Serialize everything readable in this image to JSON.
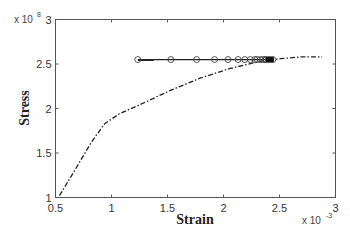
{
  "chart_data": {
    "type": "line",
    "title": "",
    "xlabel": "Strain",
    "ylabel": "Stress",
    "x_multiplier": "x 10",
    "x_multiplier_exp": "-3",
    "y_multiplier": "x 10",
    "y_multiplier_exp": "8",
    "xlim": [
      0.5,
      3
    ],
    "ylim": [
      1,
      3
    ],
    "xticks": [
      0.5,
      1,
      1.5,
      2,
      2.5,
      3
    ],
    "xtick_labels": [
      "0.5",
      "1",
      "1.5",
      "2",
      "2.5",
      "3"
    ],
    "yticks": [
      1,
      1.5,
      2,
      2.5,
      3
    ],
    "ytick_labels": [
      "1",
      "1.5",
      "2",
      "2.5",
      "3"
    ],
    "grid": false,
    "legend": null,
    "series": [
      {
        "name": "stress-strain curve",
        "style": "dash-dot",
        "color": "#222222",
        "x": [
          0.536,
          0.67,
          0.82,
          0.94,
          1.07,
          1.25,
          1.52,
          1.79,
          2.06,
          2.33,
          2.51,
          2.69,
          2.88
        ],
        "y": [
          1.02,
          1.3,
          1.62,
          1.83,
          1.94,
          2.04,
          2.2,
          2.34,
          2.45,
          2.53,
          2.56,
          2.58,
          2.58
        ]
      },
      {
        "name": "circle-marker series",
        "style": "solid-with-circle-markers",
        "color": "#222222",
        "x": [
          1.235,
          1.53,
          1.76,
          1.92,
          2.04,
          2.13,
          2.19,
          2.24,
          2.28,
          2.3,
          2.33,
          2.35,
          2.37,
          2.38,
          2.4,
          2.42,
          2.44
        ],
        "y": [
          2.55,
          2.55,
          2.55,
          2.55,
          2.55,
          2.55,
          2.55,
          2.55,
          2.55,
          2.55,
          2.55,
          2.55,
          2.55,
          2.55,
          2.55,
          2.55,
          2.55
        ]
      }
    ]
  }
}
